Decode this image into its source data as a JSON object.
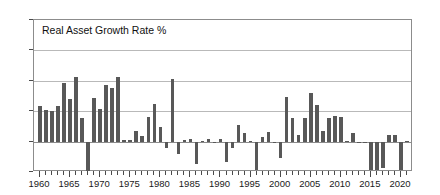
{
  "chart_data": {
    "type": "bar",
    "title": "Real Asset Growth Rate %",
    "xlabel": "",
    "ylabel": "",
    "ylim": [
      -10,
      40
    ],
    "yticks": [
      -10,
      0,
      10,
      20,
      30,
      40
    ],
    "ytick_labels": [
      "−10",
      "0",
      "10",
      "20",
      "30",
      "40"
    ],
    "xlim": [
      1959,
      2022
    ],
    "xticks": [
      1960,
      1965,
      1970,
      1975,
      1980,
      1985,
      1990,
      1995,
      2000,
      2005,
      2010,
      2015,
      2020
    ],
    "xtick_labels": [
      "1960",
      "1965",
      "1970",
      "1975",
      "1980",
      "1985",
      "1990",
      "1995",
      "2000",
      "2005",
      "2010",
      "2015",
      "2020"
    ],
    "grid": true,
    "legend": "none",
    "bar_color": "#585858",
    "categories": [
      1960,
      1961,
      1962,
      1963,
      1964,
      1965,
      1966,
      1967,
      1968,
      1969,
      1970,
      1971,
      1972,
      1973,
      1974,
      1975,
      1976,
      1977,
      1978,
      1979,
      1980,
      1981,
      1982,
      1983,
      1984,
      1985,
      1986,
      1987,
      1988,
      1989,
      1990,
      1991,
      1992,
      1993,
      1994,
      1995,
      1996,
      1997,
      1998,
      1999,
      2000,
      2001,
      2002,
      2003,
      2004,
      2005,
      2006,
      2007,
      2008,
      2009,
      2010,
      2011,
      2012,
      2013,
      2014,
      2015,
      2016,
      2017,
      2018,
      2019,
      2020,
      2021
    ],
    "values": [
      11.8,
      10.4,
      10.0,
      11.6,
      19.3,
      13.9,
      21.2,
      7.8,
      -9.6,
      14.2,
      10.7,
      18.5,
      17.6,
      21.4,
      0.6,
      0.4,
      3.4,
      1.9,
      8.1,
      12.3,
      4.8,
      -2.0,
      20.6,
      -4.1,
      0.4,
      1.0,
      -7.5,
      0.3,
      0.8,
      -0.2,
      0.9,
      -6.6,
      -2.2,
      5.3,
      2.8,
      0.2,
      -9.3,
      1.4,
      3.0,
      -0.6,
      -5.3,
      14.7,
      7.7,
      2.2,
      7.9,
      16.0,
      12.2,
      3.5,
      7.6,
      8.3,
      8.1,
      0.2,
      2.7,
      -0.4,
      -0.3,
      -9.3,
      -9.2,
      -8.8,
      2.1,
      2.3,
      -9.5,
      0.2
    ],
    "series_name": "Real Asset Growth Rate %"
  }
}
